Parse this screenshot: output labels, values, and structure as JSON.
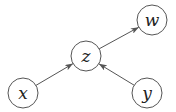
{
  "diagram": {
    "type": "directed-graph",
    "nodes": [
      {
        "id": "x",
        "label": "x",
        "cx": 23,
        "cy": 93,
        "r": 15
      },
      {
        "id": "z",
        "label": "z",
        "cx": 86,
        "cy": 56,
        "r": 15
      },
      {
        "id": "w",
        "label": "w",
        "cx": 152,
        "cy": 20,
        "r": 15
      },
      {
        "id": "y",
        "label": "y",
        "cx": 147,
        "cy": 93,
        "r": 15
      }
    ],
    "edges": [
      {
        "from": "x",
        "to": "z"
      },
      {
        "from": "y",
        "to": "z"
      },
      {
        "from": "z",
        "to": "w"
      }
    ],
    "colors": {
      "stroke": "#555555",
      "label": "#222222",
      "background": "#ffffff"
    }
  }
}
